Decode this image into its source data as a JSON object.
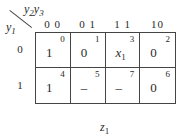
{
  "kmap": {
    "col_var": {
      "name": "y",
      "subs": [
        "2",
        "3"
      ]
    },
    "row_var": {
      "name": "y",
      "sub": "1"
    },
    "col_headers": [
      "0 0",
      "0 1",
      "1 1",
      "10"
    ],
    "row_headers": [
      "0",
      "1"
    ],
    "cells": [
      [
        {
          "value": "1",
          "index": "0"
        },
        {
          "value": "0",
          "index": "1"
        },
        {
          "value": "x",
          "value_sub": "1",
          "index": "3"
        },
        {
          "value": "0",
          "index": "2"
        }
      ],
      [
        {
          "value": "1",
          "index": "4"
        },
        {
          "value": "–",
          "index": "5"
        },
        {
          "value": "–",
          "index": "7"
        },
        {
          "value": "0",
          "index": "6"
        }
      ]
    ],
    "output": {
      "name": "z",
      "sub": "1"
    }
  }
}
